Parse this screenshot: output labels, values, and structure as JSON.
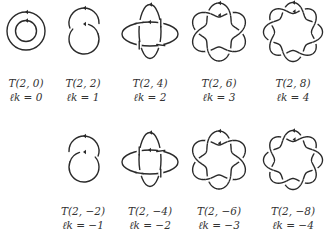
{
  "figure": {
    "stroke_color": "#2a2a2a",
    "background": "#ffffff",
    "top_row": [
      {
        "id": "T2_0",
        "label": "T(2, 0)",
        "linking": "ℓk = 0",
        "n": 0,
        "cx": 26,
        "cy": 31,
        "label_x": 26
      },
      {
        "id": "T2_2",
        "label": "T(2, 2)",
        "linking": "ℓk = 1",
        "n": 2,
        "cx": 84,
        "cy": 31,
        "label_x": 83
      },
      {
        "id": "T2_4",
        "label": "T(2, 4)",
        "linking": "ℓk = 2",
        "n": 4,
        "cx": 150,
        "cy": 31,
        "label_x": 150
      },
      {
        "id": "T2_6",
        "label": "T(2, 6)",
        "linking": "ℓk = 3",
        "n": 6,
        "cx": 219,
        "cy": 31,
        "label_x": 219
      },
      {
        "id": "T2_8",
        "label": "T(2, 8)",
        "linking": "ℓk = 4",
        "n": 8,
        "cx": 293,
        "cy": 31,
        "label_x": 293
      }
    ],
    "bottom_row": [
      {
        "id": "T2_m2",
        "label": "T(2, −2)",
        "linking": "ℓk = −1",
        "n": -2,
        "cx": 84,
        "cy": 159,
        "label_x": 83
      },
      {
        "id": "T2_m4",
        "label": "T(2, −4)",
        "linking": "ℓk = −2",
        "n": -4,
        "cx": 150,
        "cy": 159,
        "label_x": 150
      },
      {
        "id": "T2_m6",
        "label": "T(2, −6)",
        "linking": "ℓk = −3",
        "n": -6,
        "cx": 219,
        "cy": 159,
        "label_x": 219
      },
      {
        "id": "T2_m8",
        "label": "T(2, −8)",
        "linking": "ℓk = −4",
        "n": -8,
        "cx": 293,
        "cy": 159,
        "label_x": 293
      }
    ]
  }
}
